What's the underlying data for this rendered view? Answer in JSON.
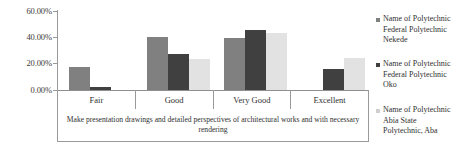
{
  "chart_data": {
    "type": "bar",
    "title": "",
    "subtitle": "",
    "xlabel": "Make presentation drawings and detailed perspectives of architectural works and with necessary rendering",
    "ylabel": "",
    "categories": [
      "Fair",
      "Good",
      "Very Good",
      "Excellent"
    ],
    "ylim": [
      0,
      60
    ],
    "ytick_values": [
      0,
      20,
      40,
      60
    ],
    "ytick_labels": [
      "0.00%",
      "20.00%",
      "40.00%",
      "60.00%"
    ],
    "grid": false,
    "legend_position": "right",
    "series": [
      {
        "name": "Name of Polytechnic\nFederal Polytechnic\nNekede",
        "color": "#808080",
        "values": [
          17.5,
          40.5,
          40.0,
          0.0
        ]
      },
      {
        "name": "Name of Polytechnic\nFederal Polytechnic\nOko",
        "color": "#404040",
        "values": [
          2.0,
          27.5,
          46.0,
          16.0
        ]
      },
      {
        "name": "Name of Polytechnic\nAbia State\nPolytechnic, Aba",
        "color": "#e2e2e2",
        "values": [
          0.0,
          24.0,
          44.0,
          25.0
        ]
      }
    ]
  },
  "axis": {
    "y_labels": [
      "60.00%",
      "40.00%",
      "20.00%",
      "0.00%"
    ]
  },
  "legend": {
    "items": [
      {
        "label": "Name of Polytechnic\nFederal Polytechnic\nNekede"
      },
      {
        "label": "Name of Polytechnic\nFederal Polytechnic\nOko"
      },
      {
        "label": "Name of Polytechnic\nAbia State\nPolytechnic, Aba"
      }
    ]
  }
}
